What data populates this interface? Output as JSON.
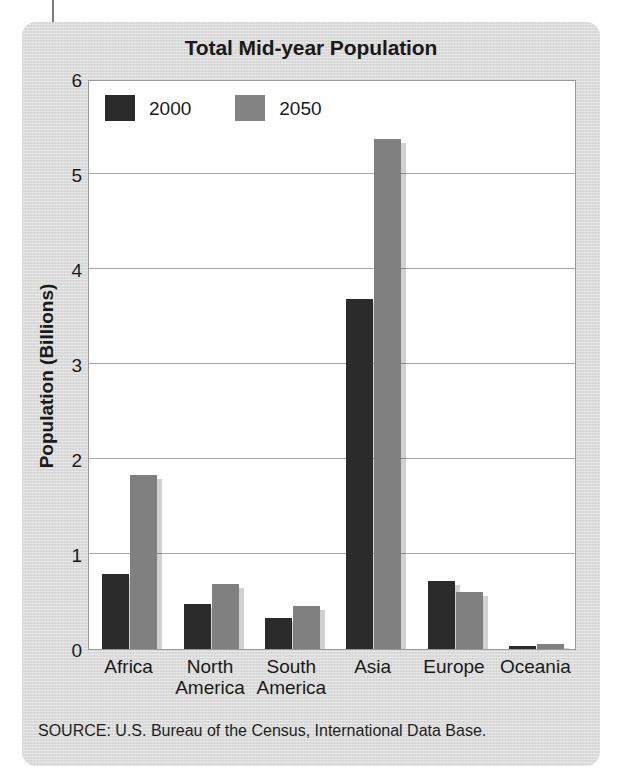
{
  "figure": {
    "title": "Total Mid-year Population",
    "source": "SOURCE: U.S. Bureau of the Census, International Data Base.",
    "panel_color": "#dcdcdc",
    "plot_background": "#ffffff",
    "frame_color": "#9a9a9a",
    "gridline_color": "#a8a8a8"
  },
  "chart_data": {
    "type": "bar",
    "title": "Total Mid-year Population",
    "xlabel": "",
    "ylabel": "Population (Billions)",
    "ylim": [
      0,
      6
    ],
    "yticks": [
      0,
      1,
      2,
      3,
      4,
      5,
      6
    ],
    "ytick_labels": [
      "0",
      "1",
      "2",
      "3",
      "4",
      "5",
      "6"
    ],
    "grid": true,
    "legend_position": "top-left inside plot",
    "categories": [
      "Africa",
      "North America",
      "South America",
      "Asia",
      "Europe",
      "Oceania"
    ],
    "category_labels": [
      "Africa",
      "North\nAmerica",
      "South\nAmerica",
      "Asia",
      "Europe",
      "Oceania"
    ],
    "series": [
      {
        "name": "2000",
        "color": "#2b2b2b",
        "values": [
          0.79,
          0.47,
          0.33,
          3.68,
          0.72,
          0.03
        ]
      },
      {
        "name": "2050",
        "color": "#808080",
        "values": [
          1.83,
          0.68,
          0.45,
          5.37,
          0.6,
          0.05
        ]
      }
    ]
  }
}
